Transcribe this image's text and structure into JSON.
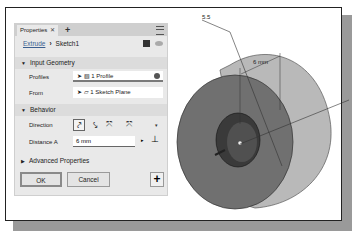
{
  "panel": {
    "tab_label": "Properties",
    "tab_close": "✕",
    "add_tab": "+",
    "breadcrumb": {
      "parent": "Extrude",
      "separator": "›",
      "current": "Sketch1"
    },
    "sections": {
      "input_geometry": {
        "title": "Input Geometry",
        "profiles_label": "Profiles",
        "profiles_value": "1 Profile",
        "from_label": "From",
        "from_value": "1 Sketch Plane"
      },
      "behavior": {
        "title": "Behavior",
        "direction_label": "Direction",
        "direction_options": [
          "default",
          "flipped",
          "symmetric",
          "asymmetric"
        ],
        "distance_label": "Distance A",
        "distance_value": "6 mm"
      },
      "advanced": {
        "title": "Advanced Properties"
      }
    },
    "buttons": {
      "ok": "OK",
      "cancel": "Cancel",
      "add": "+"
    }
  },
  "viewport": {
    "dimension_callout": "5.5",
    "dimension_label": "6 mm"
  },
  "colors": {
    "panel_bg": "#e9e9e9",
    "section_bg": "#dcdcdc",
    "face_dark": "#6e6e6e",
    "face_light": "#b4b4b4"
  }
}
